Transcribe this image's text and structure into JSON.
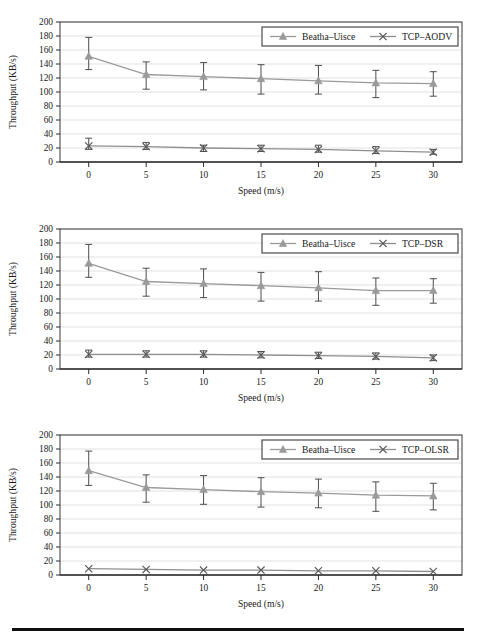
{
  "figure": {
    "panel_count": 3,
    "bottom_rule": true,
    "series_colors": {
      "beatha": "#9a9a9a",
      "tcp": "#8f8f8f",
      "grid": "#d9d9d9",
      "frame": "#4a4a4a",
      "text": "#1a1a1a"
    }
  },
  "chart_data": [
    {
      "type": "line",
      "title": "",
      "xlabel": "Speed (m/s)",
      "ylabel": "Throughput (KB/s)",
      "x": [
        0,
        5,
        10,
        15,
        20,
        25,
        30
      ],
      "xtick_labels": [
        "0",
        "5",
        "10",
        "15",
        "20",
        "25",
        "30"
      ],
      "xlim": [
        -2.5,
        32.5
      ],
      "ylim": [
        0,
        200
      ],
      "ytick_labels": [
        "0",
        "20",
        "40",
        "60",
        "80",
        "100",
        "120",
        "140",
        "160",
        "180",
        "200"
      ],
      "yticks": [
        0,
        20,
        40,
        60,
        80,
        100,
        120,
        140,
        160,
        180,
        200
      ],
      "grid": "horizontal",
      "legend_position": "top-right",
      "series": [
        {
          "name": "Beatha–Uisce",
          "marker": "triangle",
          "values": [
            151,
            125,
            122,
            119,
            116,
            113,
            112
          ],
          "err_lower": [
            19,
            21,
            19,
            22,
            19,
            21,
            18
          ],
          "err_upper": [
            27,
            18,
            20,
            20,
            22,
            18,
            17
          ]
        },
        {
          "name": "TCP–AODV",
          "marker": "x",
          "values": [
            23,
            22,
            20,
            19,
            18,
            16,
            14
          ],
          "err_lower": [
            5,
            4,
            5,
            4,
            4,
            4,
            3
          ],
          "err_upper": [
            11,
            6,
            4,
            5,
            6,
            6,
            4
          ]
        }
      ]
    },
    {
      "type": "line",
      "title": "",
      "xlabel": "Speed (m/s)",
      "ylabel": "Throughput (KB/s)",
      "x": [
        0,
        5,
        10,
        15,
        20,
        25,
        30
      ],
      "xtick_labels": [
        "0",
        "5",
        "10",
        "15",
        "20",
        "25",
        "30"
      ],
      "xlim": [
        -2.5,
        32.5
      ],
      "ylim": [
        0,
        200
      ],
      "ytick_labels": [
        "0",
        "20",
        "40",
        "60",
        "80",
        "100",
        "120",
        "140",
        "160",
        "180",
        "200"
      ],
      "yticks": [
        0,
        20,
        40,
        60,
        80,
        100,
        120,
        140,
        160,
        180,
        200
      ],
      "grid": "horizontal",
      "legend_position": "top-right",
      "series": [
        {
          "name": "Beatha–Uisce",
          "marker": "triangle",
          "values": [
            151,
            125,
            122,
            119,
            116,
            112,
            112
          ],
          "err_lower": [
            20,
            21,
            20,
            22,
            19,
            21,
            18
          ],
          "err_upper": [
            27,
            19,
            21,
            19,
            23,
            18,
            17
          ]
        },
        {
          "name": "TCP–DSR",
          "marker": "x",
          "values": [
            21,
            21,
            21,
            20,
            19,
            18,
            16
          ],
          "err_lower": [
            4,
            4,
            4,
            4,
            4,
            4,
            4
          ],
          "err_upper": [
            6,
            5,
            5,
            5,
            5,
            5,
            4
          ]
        }
      ]
    },
    {
      "type": "line",
      "title": "",
      "xlabel": "Speed (m/s)",
      "ylabel": "Throughput (KB/s)",
      "x": [
        0,
        5,
        10,
        15,
        20,
        25,
        30
      ],
      "xtick_labels": [
        "0",
        "5",
        "10",
        "15",
        "20",
        "25",
        "30"
      ],
      "xlim": [
        -2.5,
        32.5
      ],
      "ylim": [
        0,
        200
      ],
      "ytick_labels": [
        "0",
        "20",
        "40",
        "60",
        "80",
        "100",
        "120",
        "140",
        "160",
        "180",
        "200"
      ],
      "yticks": [
        0,
        20,
        40,
        60,
        80,
        100,
        120,
        140,
        160,
        180,
        200
      ],
      "grid": "horizontal",
      "legend_position": "top-right",
      "series": [
        {
          "name": "Beatha–Uisce",
          "marker": "triangle",
          "values": [
            149,
            125,
            122,
            119,
            117,
            114,
            113
          ],
          "err_lower": [
            21,
            21,
            21,
            22,
            21,
            23,
            20
          ],
          "err_upper": [
            28,
            18,
            20,
            20,
            20,
            19,
            18
          ]
        },
        {
          "name": "TCP–OLSR",
          "marker": "x",
          "values": [
            9,
            8,
            7,
            7,
            6,
            6,
            5
          ]
        }
      ]
    }
  ]
}
